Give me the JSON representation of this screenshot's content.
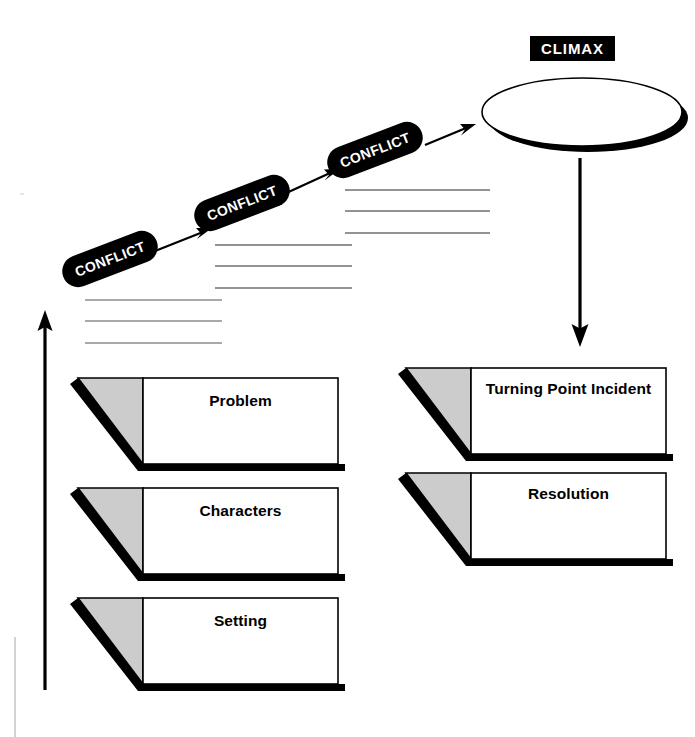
{
  "diagram": {
    "background_color": "#ffffff",
    "ink_color": "#000000",
    "shade_color": "#cccccc",
    "rule_color": "#888888"
  },
  "climax": {
    "label": "CLIMAX",
    "shape": "oval"
  },
  "conflicts": [
    {
      "label": "CONFLICT"
    },
    {
      "label": "CONFLICT"
    },
    {
      "label": "CONFLICT"
    }
  ],
  "rule_line_groups": [
    {
      "name": "conflict-1-lines",
      "count": 3
    },
    {
      "name": "conflict-2-lines",
      "count": 3
    },
    {
      "name": "conflict-3-lines",
      "count": 3
    }
  ],
  "boxes": {
    "left_column": [
      {
        "label": "Problem"
      },
      {
        "label": "Characters"
      },
      {
        "label": "Setting"
      }
    ],
    "right_column": [
      {
        "label": "Turning Point Incident"
      },
      {
        "label": "Resolution"
      }
    ]
  },
  "arrows": {
    "rising_action": "upward-left-arrow",
    "falling_action": "downward-arrow",
    "conflict_links": [
      "arrow-conflict-1-to-2",
      "arrow-conflict-2-to-3",
      "arrow-conflict-3-to-climax"
    ]
  }
}
